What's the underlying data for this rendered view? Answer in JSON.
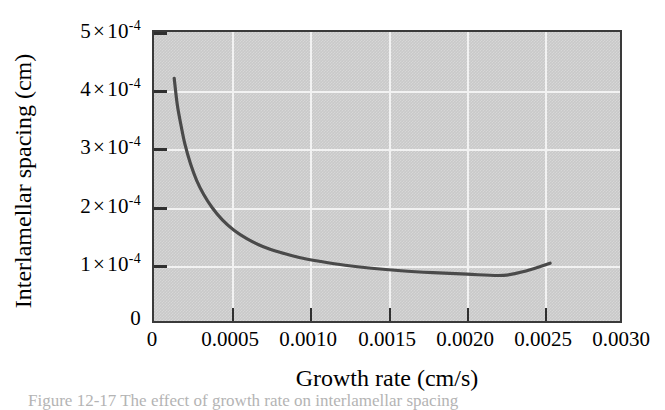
{
  "chart_data": {
    "type": "line",
    "title": "",
    "xlabel": "Growth rate (cm/s)",
    "ylabel": "Interlamellar spacing (cm)",
    "xlim": [
      0,
      0.003
    ],
    "ylim": [
      0,
      0.0005
    ],
    "grid": true,
    "legend": null,
    "x_ticks": [
      0,
      0.0005,
      0.001,
      0.0015,
      0.002,
      0.0025,
      0.003
    ],
    "x_tick_labels": [
      "0",
      "0.0005",
      "0.0010",
      "0.0015",
      "0.0020",
      "0.0025",
      "0.0030"
    ],
    "y_ticks": [
      0,
      0.0001,
      0.0002,
      0.0003,
      0.0004,
      0.0005
    ],
    "y_tick_labels": [
      "0",
      "1 × 10-4",
      "2 × 10-4",
      "3 × 10-4",
      "4 × 10-4",
      "5 × 10-4"
    ],
    "series": [
      {
        "name": "interlamellar-spacing",
        "relation": "lambda = C / R, C = 5.4e-8",
        "x": [
          0.00013,
          0.00015,
          0.000175,
          0.0002,
          0.000235,
          0.000275,
          0.00032,
          0.000375,
          0.00044,
          0.000515,
          0.0006,
          0.0007,
          0.00081,
          0.000935,
          0.001075,
          0.00123,
          0.0014,
          0.00159,
          0.001795,
          0.002015,
          0.00225,
          0.0024,
          0.00255
        ],
        "y": [
          0.00042,
          0.000374,
          0.000337,
          0.000305,
          0.000272,
          0.000243,
          0.000219,
          0.000196,
          0.000175,
          0.000157,
          0.000142,
          0.000129,
          0.000119,
          0.00011,
          0.000103,
          9.65e-05,
          9.13e-05,
          8.7e-05,
          8.37e-05,
          8.1e-05,
          7.9e-05,
          8.7e-05,
          0.0001
        ]
      }
    ],
    "curve_start": {
      "x": 0.00013,
      "y": 0.00042
    },
    "curve_end": {
      "x": 0.00255,
      "y": 0.0001
    }
  },
  "axis": {
    "y_tick_labels": [
      {
        "mantissa": "5",
        "times": "×",
        "base": "10",
        "exponent": "-4"
      },
      {
        "mantissa": "4",
        "times": "×",
        "base": "10",
        "exponent": "-4"
      },
      {
        "mantissa": "3",
        "times": "×",
        "base": "10",
        "exponent": "-4"
      },
      {
        "mantissa": "2",
        "times": "×",
        "base": "10",
        "exponent": "-4"
      },
      {
        "mantissa": "1",
        "times": "×",
        "base": "10",
        "exponent": "-4"
      },
      {
        "mantissa": "0",
        "times": "",
        "base": "",
        "exponent": ""
      }
    ],
    "x_tick_labels": [
      "0",
      "0.0005",
      "0.0010",
      "0.0015",
      "0.0020",
      "0.0025",
      "0.0030"
    ],
    "x_title": "Growth rate (cm/s)",
    "y_title": "Interlamellar spacing (cm)"
  },
  "colors": {
    "plot_background": "#c9c9c9",
    "gridline": "#f2f2f2",
    "frame": "#3a3a3a",
    "curve": "#4a4a4a",
    "text": "#000000",
    "page_background": "#ffffff"
  },
  "caption": {
    "text": "Figure 12-17   The effect of growth rate on interlamellar spacing"
  }
}
